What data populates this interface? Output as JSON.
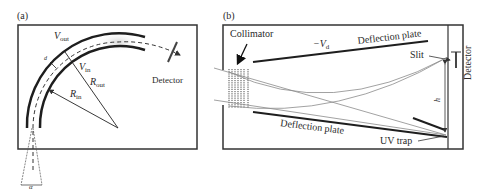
{
  "panel_a": {
    "tag": "(a)",
    "labels": {
      "v_out": "V",
      "v_out_sub": "out",
      "v_in": "V",
      "v_in_sub": "in",
      "r_out": "R",
      "r_out_sub": "out",
      "r_in": "R",
      "r_in_sub": "in",
      "gap": "d",
      "detector": "Detector",
      "angle": "α"
    }
  },
  "panel_b": {
    "tag": "(b)",
    "labels": {
      "collimator": "Collimator",
      "voltage": "−V",
      "voltage_sub": "d",
      "top_plate": "Deflection plate",
      "bottom_plate": "Deflection plate",
      "slit": "Slit",
      "detector": "Detector",
      "height": "h",
      "uv_trap": "UV trap"
    }
  },
  "colors": {
    "stroke": "#1e1e1e",
    "trajectory": "#8a8a8a",
    "frame": "#333333"
  }
}
